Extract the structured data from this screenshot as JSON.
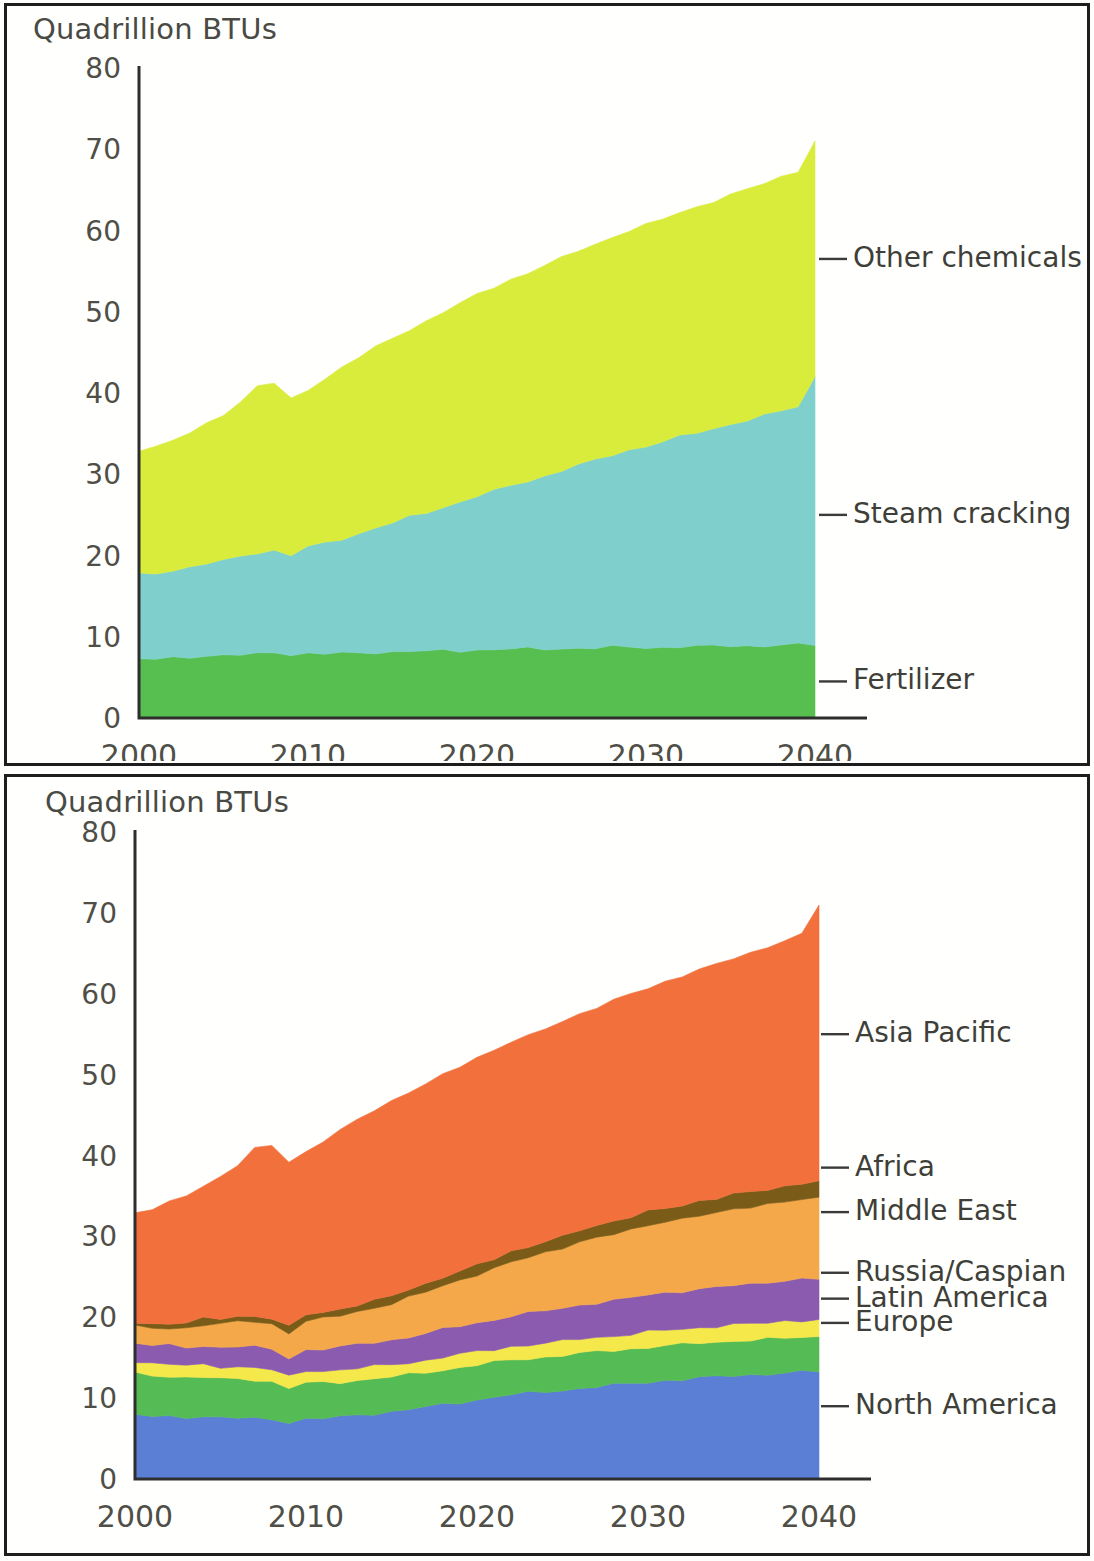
{
  "figure": {
    "background_color": "#fffffd",
    "frame_color": "#1d1d1d",
    "axis_color": "#2e2e2e"
  },
  "panels": [
    {
      "id": "chart-by-process",
      "axis_title": "Quadrillion BTUs"
    },
    {
      "id": "chart-by-region",
      "axis_title": "Quadrillion BTUs"
    }
  ],
  "chart_data": [
    {
      "type": "area",
      "id": "chart-by-process",
      "title": "",
      "subtitle": "",
      "xlabel": "",
      "ylabel": "Quadrillion BTUs",
      "stacked": true,
      "grid": false,
      "legend_position": "right-inline",
      "xlim": [
        2000,
        2040
      ],
      "ylim": [
        0,
        80
      ],
      "ytick_labels": [
        "0",
        "10",
        "20",
        "30",
        "40",
        "50",
        "60",
        "70",
        "80"
      ],
      "ytick_values": [
        0,
        10,
        20,
        30,
        40,
        50,
        60,
        70,
        80
      ],
      "xtick_labels": [
        "2000",
        "2010",
        "2020",
        "2030",
        "2040"
      ],
      "xtick_values": [
        2000,
        2010,
        2020,
        2030,
        2040
      ],
      "x": [
        2000,
        2001,
        2002,
        2003,
        2004,
        2005,
        2006,
        2007,
        2008,
        2009,
        2010,
        2011,
        2012,
        2013,
        2014,
        2015,
        2016,
        2017,
        2018,
        2019,
        2020,
        2021,
        2022,
        2023,
        2024,
        2025,
        2026,
        2027,
        2028,
        2029,
        2030,
        2031,
        2032,
        2033,
        2034,
        2035,
        2036,
        2037,
        2038,
        2039,
        2040
      ],
      "series": [
        {
          "name": "Fertilizer",
          "color": "#57bf4f",
          "values": [
            7.3,
            7.3,
            7.4,
            7.5,
            7.6,
            7.7,
            7.8,
            7.9,
            8.1,
            7.8,
            7.9,
            7.9,
            8.0,
            8.0,
            8.1,
            8.1,
            8.2,
            8.2,
            8.3,
            8.3,
            8.4,
            8.4,
            8.5,
            8.5,
            8.5,
            8.6,
            8.6,
            8.6,
            8.7,
            8.7,
            8.7,
            8.7,
            8.8,
            8.8,
            8.8,
            8.9,
            8.9,
            8.9,
            9.0,
            9.0,
            9.0
          ]
        },
        {
          "name": "Steam cracking",
          "color": "#7fd0cc",
          "values": [
            10.4,
            10.5,
            10.8,
            11.0,
            11.4,
            11.7,
            12.1,
            12.5,
            12.5,
            12.2,
            13.2,
            13.6,
            14.1,
            14.7,
            15.3,
            15.9,
            16.5,
            17.1,
            17.7,
            18.3,
            18.9,
            19.5,
            20.1,
            20.7,
            21.3,
            21.9,
            22.5,
            23.1,
            23.7,
            24.3,
            24.8,
            25.3,
            25.8,
            26.3,
            26.8,
            27.3,
            27.8,
            28.3,
            28.8,
            29.3,
            33.0
          ]
        },
        {
          "name": "Other chemicals",
          "color": "#d9ec3c",
          "values": [
            15.3,
            15.6,
            16.0,
            16.5,
            17.2,
            18.0,
            19.0,
            20.5,
            20.6,
            19.2,
            19.3,
            20.3,
            21.1,
            21.7,
            22.2,
            22.7,
            23.1,
            23.6,
            24.0,
            24.4,
            24.8,
            25.1,
            25.4,
            25.6,
            25.9,
            26.1,
            26.4,
            26.6,
            26.8,
            27.0,
            27.2,
            27.4,
            27.6,
            27.8,
            28.0,
            28.2,
            28.4,
            28.6,
            28.8,
            29.0,
            29.0
          ]
        }
      ],
      "totals": [
        33.0,
        33.4,
        34.2,
        35.0,
        36.2,
        37.4,
        38.9,
        40.9,
        41.2,
        39.2,
        40.4,
        41.8,
        43.2,
        44.4,
        45.6,
        46.7,
        47.8,
        48.9,
        50.0,
        51.0,
        52.1,
        53.0,
        54.0,
        54.8,
        55.7,
        56.6,
        57.5,
        58.3,
        59.2,
        60.0,
        60.7,
        61.4,
        62.2,
        62.9,
        63.6,
        64.4,
        65.1,
        65.8,
        66.6,
        67.3,
        71.0
      ],
      "annotations": [
        {
          "label": "Other chemicals",
          "color": "#d9ec3c",
          "value_at_2040": 29.0
        },
        {
          "label": "Steam cracking",
          "color": "#7fd0cc",
          "value_at_2040": 33.0
        },
        {
          "label": "Fertilizer",
          "color": "#57bf4f",
          "value_at_2040": 9.0
        }
      ]
    },
    {
      "type": "area",
      "id": "chart-by-region",
      "title": "",
      "subtitle": "",
      "xlabel": "",
      "ylabel": "Quadrillion BTUs",
      "stacked": true,
      "grid": false,
      "legend_position": "right-inline",
      "xlim": [
        2000,
        2040
      ],
      "ylim": [
        0,
        80
      ],
      "ytick_labels": [
        "0",
        "10",
        "20",
        "30",
        "40",
        "50",
        "60",
        "70",
        "80"
      ],
      "ytick_values": [
        0,
        10,
        20,
        30,
        40,
        50,
        60,
        70,
        80
      ],
      "xtick_labels": [
        "2000",
        "2010",
        "2020",
        "2030",
        "2040"
      ],
      "xtick_values": [
        2000,
        2010,
        2020,
        2030,
        2040
      ],
      "x": [
        2000,
        2001,
        2002,
        2003,
        2004,
        2005,
        2006,
        2007,
        2008,
        2009,
        2010,
        2011,
        2012,
        2013,
        2014,
        2015,
        2016,
        2017,
        2018,
        2019,
        2020,
        2021,
        2022,
        2023,
        2024,
        2025,
        2026,
        2027,
        2028,
        2029,
        2030,
        2031,
        2032,
        2033,
        2034,
        2035,
        2036,
        2037,
        2038,
        2039,
        2040
      ],
      "series": [
        {
          "name": "North America",
          "color": "#5b7fd4",
          "values": [
            8.0,
            7.8,
            7.7,
            7.6,
            7.7,
            7.6,
            7.6,
            7.5,
            7.4,
            7.0,
            7.4,
            7.5,
            7.7,
            7.9,
            8.1,
            8.3,
            8.6,
            8.9,
            9.2,
            9.5,
            9.8,
            10.1,
            10.4,
            10.6,
            10.8,
            11.0,
            11.2,
            11.4,
            11.6,
            11.8,
            12.0,
            12.2,
            12.3,
            12.5,
            12.6,
            12.8,
            12.9,
            13.0,
            13.1,
            13.2,
            13.3
          ]
        },
        {
          "name": "Europe",
          "color": "#55bb55",
          "values": [
            5.1,
            5.0,
            5.0,
            4.9,
            4.9,
            4.8,
            4.8,
            4.8,
            4.6,
            4.2,
            4.5,
            4.4,
            4.3,
            4.3,
            4.3,
            4.3,
            4.3,
            4.3,
            4.3,
            4.3,
            4.3,
            4.3,
            4.3,
            4.3,
            4.3,
            4.3,
            4.3,
            4.3,
            4.3,
            4.3,
            4.3,
            4.3,
            4.3,
            4.3,
            4.3,
            4.3,
            4.3,
            4.3,
            4.3,
            4.3,
            4.3
          ]
        },
        {
          "name": "Latin America",
          "color": "#f5e84a",
          "values": [
            1.5,
            1.5,
            1.5,
            1.5,
            1.5,
            1.5,
            1.5,
            1.5,
            1.5,
            1.4,
            1.5,
            1.5,
            1.5,
            1.5,
            1.5,
            1.5,
            1.5,
            1.5,
            1.6,
            1.6,
            1.6,
            1.6,
            1.7,
            1.7,
            1.7,
            1.7,
            1.8,
            1.8,
            1.8,
            1.8,
            1.9,
            1.9,
            1.9,
            1.9,
            2.0,
            2.0,
            2.0,
            2.0,
            2.1,
            2.1,
            2.1
          ]
        },
        {
          "name": "Russia/Caspian",
          "color": "#8a5baf",
          "values": [
            2.2,
            2.2,
            2.3,
            2.3,
            2.4,
            2.4,
            2.5,
            2.5,
            2.5,
            2.4,
            2.6,
            2.7,
            2.8,
            2.9,
            3.0,
            3.1,
            3.2,
            3.3,
            3.4,
            3.5,
            3.6,
            3.7,
            3.8,
            3.9,
            4.0,
            4.1,
            4.2,
            4.3,
            4.4,
            4.5,
            4.6,
            4.6,
            4.7,
            4.8,
            4.8,
            4.9,
            4.9,
            5.0,
            5.0,
            5.1,
            5.1
          ]
        },
        {
          "name": "Middle East",
          "color": "#f5a84a",
          "values": [
            2.0,
            2.1,
            2.2,
            2.4,
            2.6,
            2.8,
            3.0,
            3.2,
            3.2,
            3.1,
            3.5,
            3.7,
            3.9,
            4.1,
            4.3,
            4.5,
            4.8,
            5.1,
            5.4,
            5.7,
            6.0,
            6.3,
            6.6,
            6.9,
            7.2,
            7.5,
            7.8,
            8.0,
            8.2,
            8.4,
            8.6,
            8.8,
            8.9,
            9.1,
            9.2,
            9.4,
            9.5,
            9.6,
            9.8,
            9.9,
            10.0
          ]
        },
        {
          "name": "Africa",
          "color": "#7a5c18",
          "values": [
            0.6,
            0.6,
            0.6,
            0.6,
            0.7,
            0.7,
            0.7,
            0.7,
            0.7,
            0.7,
            0.8,
            0.8,
            0.8,
            0.9,
            0.9,
            0.9,
            1.0,
            1.0,
            1.1,
            1.1,
            1.2,
            1.2,
            1.3,
            1.3,
            1.4,
            1.4,
            1.5,
            1.5,
            1.6,
            1.6,
            1.7,
            1.7,
            1.7,
            1.8,
            1.8,
            1.8,
            1.9,
            1.9,
            1.9,
            2.0,
            2.0
          ]
        },
        {
          "name": "Asia Pacific",
          "color": "#f2703c",
          "values": [
            13.6,
            14.2,
            14.9,
            15.7,
            16.4,
            17.6,
            18.8,
            20.7,
            21.3,
            20.4,
            20.1,
            21.2,
            22.2,
            22.8,
            23.5,
            24.1,
            24.4,
            24.8,
            25.0,
            25.3,
            25.6,
            25.8,
            26.0,
            26.1,
            26.3,
            26.6,
            26.7,
            27.0,
            27.3,
            27.6,
            27.6,
            28.0,
            28.4,
            28.6,
            28.9,
            29.2,
            29.6,
            30.0,
            30.4,
            30.7,
            34.2
          ]
        }
      ],
      "totals": [
        33.0,
        33.4,
        34.2,
        35.0,
        36.2,
        37.4,
        38.9,
        41.0,
        41.2,
        39.2,
        40.4,
        41.8,
        43.2,
        44.4,
        45.6,
        46.7,
        47.8,
        48.9,
        50.0,
        51.0,
        52.1,
        53.0,
        54.1,
        54.8,
        55.7,
        56.6,
        57.5,
        58.3,
        59.2,
        60.0,
        60.7,
        61.5,
        62.2,
        63.0,
        63.6,
        64.4,
        65.1,
        65.8,
        66.6,
        67.3,
        71.0
      ],
      "annotations": [
        {
          "label": "Asia Pacific",
          "color": "#f2703c",
          "value_at_2040": 34.2
        },
        {
          "label": "Africa",
          "color": "#7a5c18",
          "value_at_2040": 2.0
        },
        {
          "label": "Middle East",
          "color": "#f5a84a",
          "value_at_2040": 10.0
        },
        {
          "label": "Russia/Caspian",
          "color": "#8a5baf",
          "value_at_2040": 5.1
        },
        {
          "label": "Latin America",
          "color": "#f5e84a",
          "value_at_2040": 2.1
        },
        {
          "label": "Europe",
          "color": "#55bb55",
          "value_at_2040": 4.3
        },
        {
          "label": "North America",
          "color": "#5b7fd4",
          "value_at_2040": 13.3
        }
      ],
      "label_anchor_y": {
        "Asia Pacific": 55,
        "Africa": 38.5,
        "Middle East": 33,
        "Russia/Caspian": 25.5,
        "Latin America": 22.3,
        "Europe": 19.3,
        "North America": 9.0
      }
    }
  ]
}
